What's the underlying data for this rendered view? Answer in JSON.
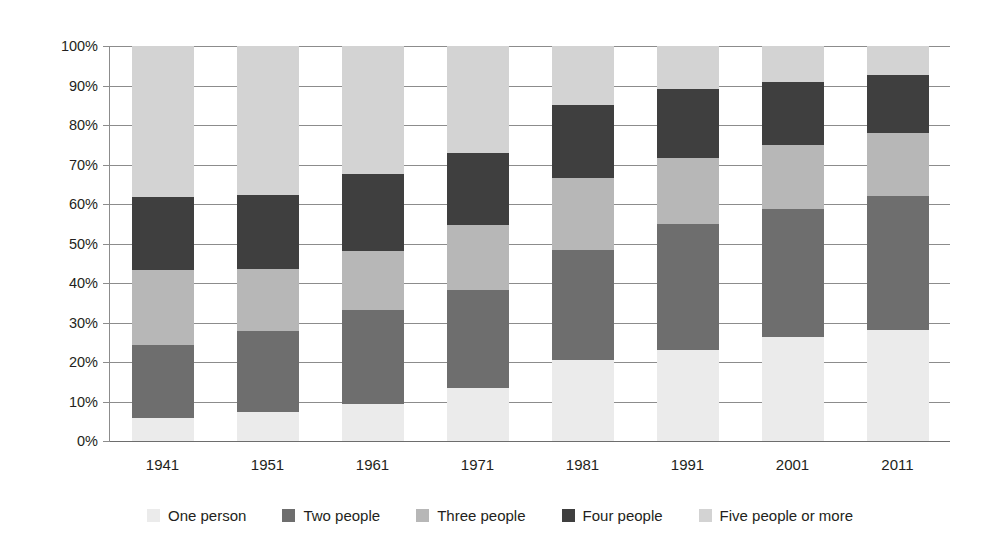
{
  "chart_data": {
    "type": "bar",
    "stacked": true,
    "title": "",
    "xlabel": "",
    "ylabel": "",
    "categories": [
      "1941",
      "1951",
      "1961",
      "1971",
      "1981",
      "1991",
      "2001",
      "2011"
    ],
    "ylim": [
      0,
      100
    ],
    "ytick_labels": [
      "0%",
      "10%",
      "20%",
      "30%",
      "40%",
      "50%",
      "60%",
      "70%",
      "80%",
      "90%",
      "100%"
    ],
    "ytick_values": [
      0,
      10,
      20,
      30,
      40,
      50,
      60,
      70,
      80,
      90,
      100
    ],
    "grid": true,
    "legend_position": "bottom",
    "series": [
      {
        "name": "One person",
        "color": "#ebebeb",
        "values": [
          5.8,
          7.3,
          9.4,
          13.4,
          20.5,
          23.0,
          26.3,
          28.1
        ]
      },
      {
        "name": "Two people",
        "color": "#6e6e6e",
        "values": [
          18.5,
          20.5,
          23.8,
          24.8,
          27.9,
          31.9,
          32.4,
          33.9
        ]
      },
      {
        "name": "Three people",
        "color": "#b7b7b7",
        "values": [
          19.0,
          15.7,
          15.0,
          16.5,
          18.2,
          16.7,
          16.2,
          16.0
        ]
      },
      {
        "name": "Four people",
        "color": "#3f3f3f",
        "values": [
          18.5,
          18.9,
          19.5,
          18.2,
          18.5,
          17.5,
          15.9,
          14.7
        ]
      },
      {
        "name": "Five people or more",
        "color": "#d3d3d3",
        "values": [
          38.2,
          37.6,
          32.3,
          27.1,
          14.9,
          10.9,
          9.2,
          7.3
        ]
      }
    ],
    "totals_top_percent": [
      100,
      100,
      100,
      100,
      100,
      100,
      100,
      100
    ],
    "stack_boundaries_percent": {
      "1941": [
        5.8,
        24.3,
        43.3,
        61.8,
        100
      ],
      "1951": [
        7.3,
        27.8,
        43.5,
        62.4,
        100
      ],
      "1961": [
        9.4,
        33.2,
        48.2,
        67.7,
        100
      ],
      "1971": [
        13.4,
        38.2,
        54.7,
        72.9,
        100
      ],
      "1981": [
        20.5,
        48.4,
        66.6,
        85.1,
        100
      ],
      "1991": [
        23.0,
        54.9,
        71.6,
        89.1,
        100
      ],
      "2001": [
        26.3,
        58.7,
        74.9,
        90.8,
        100
      ],
      "2011": [
        28.1,
        62.0,
        78.0,
        92.7,
        100
      ]
    }
  },
  "legend": {
    "items": [
      {
        "label": "One person",
        "color": "#ebebeb"
      },
      {
        "label": "Two people",
        "color": "#6e6e6e"
      },
      {
        "label": "Three people",
        "color": "#b7b7b7"
      },
      {
        "label": "Four people",
        "color": "#3f3f3f"
      },
      {
        "label": "Five people or more",
        "color": "#d3d3d3"
      }
    ]
  },
  "axes": {
    "y_tick_labels": [
      "100%",
      "90%",
      "80%",
      "70%",
      "60%",
      "50%",
      "40%",
      "30%",
      "20%",
      "10%",
      "0%"
    ],
    "x_tick_labels": [
      "1941",
      "1951",
      "1961",
      "1971",
      "1981",
      "1991",
      "2001",
      "2011"
    ]
  }
}
